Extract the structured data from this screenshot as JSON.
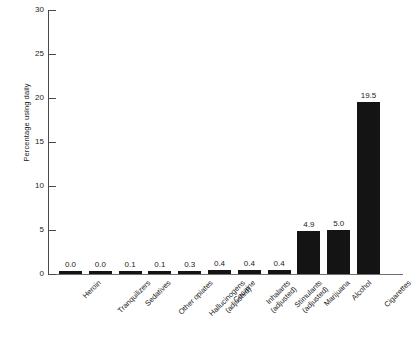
{
  "chart_data": {
    "type": "bar",
    "title": "",
    "xlabel": "",
    "ylabel": "Percentage using daily",
    "ylim": [
      0,
      30
    ],
    "yticks": [
      "0",
      "5",
      "10",
      "15",
      "20",
      "25",
      "30"
    ],
    "grid": false,
    "legend": null,
    "bar_color": "#141414",
    "categories": [
      "Heroin",
      "Tranquilizers",
      "Sedatives",
      "Other opiates",
      "Hallucinogens (adjusted)",
      "Cocaine",
      "Inhalants (adjusted)",
      "Stimulants (adjusted)",
      "Marijuana",
      "Alcohol",
      "Cigarettes"
    ],
    "category_lines": [
      [
        "Heroin",
        ""
      ],
      [
        "Tranquilizers",
        ""
      ],
      [
        "Sedatives",
        ""
      ],
      [
        "Other opiates",
        ""
      ],
      [
        "Hallucinogens",
        "(adjusted)"
      ],
      [
        "Cocaine",
        ""
      ],
      [
        "Inhalants",
        "(adjusted)"
      ],
      [
        "Stimulants",
        "(adjusted)"
      ],
      [
        "Marijuana",
        ""
      ],
      [
        "Alcohol",
        ""
      ],
      [
        "Cigarettes",
        ""
      ]
    ],
    "values": [
      0.0,
      0.0,
      0.1,
      0.1,
      0.3,
      0.4,
      0.4,
      0.4,
      4.9,
      5.0,
      19.5
    ],
    "value_labels": [
      "0.0",
      "0.0",
      "0.1",
      "0.1",
      "0.3",
      "0.4",
      "0.4",
      "0.4",
      "4.9",
      "5.0",
      "19.5"
    ]
  }
}
